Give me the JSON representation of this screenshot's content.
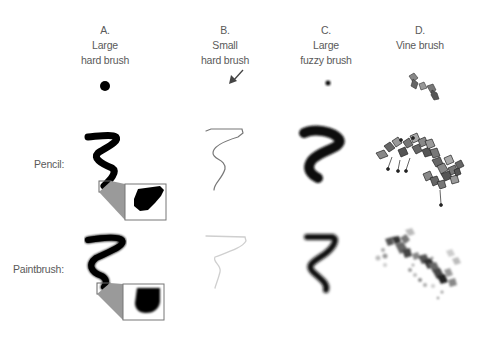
{
  "columns": [
    {
      "letter": "A.",
      "line1": "Large",
      "line2": "hard brush"
    },
    {
      "letter": "B.",
      "line1": "Small",
      "line2": "hard brush"
    },
    {
      "letter": "C.",
      "line1": "Large",
      "line2": "fuzzy brush"
    },
    {
      "letter": "D.",
      "line1": "Vine brush",
      "line2": ""
    }
  ],
  "rows": [
    {
      "label": "Pencil:"
    },
    {
      "label": "Paintbrush:"
    }
  ],
  "colors": {
    "text": "#5a5a5a",
    "stroke": "#000000",
    "callout": "#9a9a9a",
    "thin_stroke": "#777777"
  }
}
